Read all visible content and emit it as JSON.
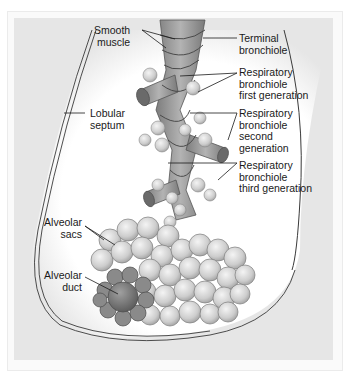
{
  "figure": {
    "colors": {
      "background": "#ffffff",
      "panel": "#e6e6e6",
      "lobule_interior": "#ffffff",
      "bronchiole": "#9a9a9a",
      "alveolus": "#cfcfcf",
      "alveolar_duct": "#7a7a7a",
      "leader_line": "#1a1a1a"
    }
  },
  "labels": {
    "smooth_muscle": "Smooth\nmuscle",
    "terminal_bronchiole": "Terminal\nbronchiole",
    "resp_bronchiole_1": "Respiratory\nbronchiole\nfirst generation",
    "resp_bronchiole_2": "Respiratory\nbronchiole\nsecond\ngeneration",
    "resp_bronchiole_3": "Respiratory\nbronchiole\nthird generation",
    "lobular_septum": "Lobular\nseptum",
    "alveolar_sacs": "Alveolar\nsacs",
    "alveolar_duct": "Alveolar\nduct"
  }
}
